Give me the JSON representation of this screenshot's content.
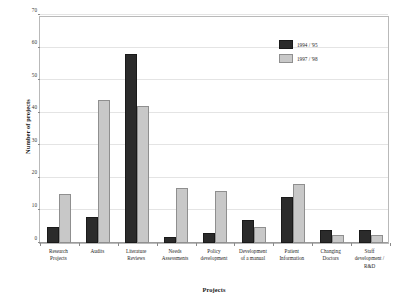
{
  "chart_data": {
    "type": "bar",
    "title": "",
    "xlabel": "Projects",
    "ylabel": "Number of projects",
    "ylim": [
      0,
      70
    ],
    "yticks": [
      0,
      10,
      20,
      30,
      40,
      50,
      60,
      70
    ],
    "grid": true,
    "legend_position": "top-right",
    "categories": [
      "Research Projects",
      "Audits",
      "Literature Reviews",
      "Needs Assessments",
      "Policy development",
      "Development of a manual",
      "Patient Information",
      "Changing Doctors",
      "Staff development / R&D"
    ],
    "category_lines": [
      [
        "Research",
        "Projects"
      ],
      [
        "Audits"
      ],
      [
        "Literature",
        "Reviews"
      ],
      [
        "Needs",
        "Assessments"
      ],
      [
        "Policy",
        "development"
      ],
      [
        "Development",
        "of a manual"
      ],
      [
        "Patient",
        "Information"
      ],
      [
        "Changing",
        "Doctors"
      ],
      [
        "Staff",
        "development /",
        "R&D"
      ]
    ],
    "series": [
      {
        "name": "1994 / '95",
        "color": "#2b2b2b",
        "values": [
          5,
          8,
          58,
          2,
          3,
          7,
          14,
          4,
          4
        ]
      },
      {
        "name": "1997 / '98",
        "color": "#c8c8c8",
        "values": [
          15,
          44,
          42,
          17,
          16,
          5,
          18,
          2.5,
          2.5
        ]
      }
    ]
  }
}
